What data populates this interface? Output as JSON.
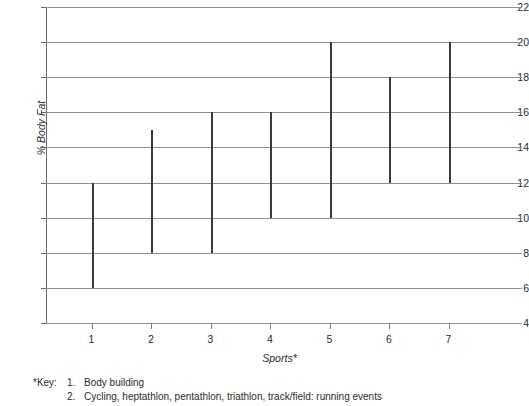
{
  "chart_data": {
    "type": "bar",
    "subtype": "floating-range-bar",
    "title": "",
    "xlabel": "Sports*",
    "ylabel": "% Body Fat",
    "categories": [
      "1",
      "2",
      "3",
      "4",
      "5",
      "6",
      "7"
    ],
    "series": [
      {
        "name": "% Body Fat range",
        "low": [
          6,
          8,
          8,
          10,
          10,
          12,
          12
        ],
        "high": [
          12,
          15,
          16,
          16,
          20,
          18,
          20
        ]
      }
    ],
    "ylim": [
      4,
      22
    ],
    "yticks": [
      4,
      6,
      8,
      10,
      12,
      14,
      16,
      18,
      20,
      22
    ],
    "xticks": [
      "1",
      "2",
      "3",
      "4",
      "5",
      "6",
      "7"
    ],
    "grid": "horizontal",
    "legend": "none",
    "bar_color": "#3a3a3a",
    "grid_color": "#8f8f8f",
    "axis_color": "#6a6a6a"
  },
  "key": {
    "title": "*Key:",
    "entries": [
      {
        "num": "1.",
        "text": "Body building"
      },
      {
        "num": "2.",
        "text": "Cycling, heptathlon, pentathlon, triathlon, track/field: running events"
      }
    ]
  }
}
